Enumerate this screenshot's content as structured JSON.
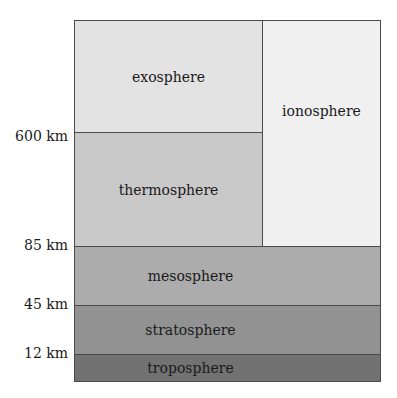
{
  "diagram": {
    "layers": [
      {
        "name": "exosphere",
        "color": "#e3e3e3"
      },
      {
        "name": "thermosphere",
        "color": "#c9c9c9"
      },
      {
        "name": "mesosphere",
        "color": "#acacac"
      },
      {
        "name": "stratosphere",
        "color": "#929292"
      },
      {
        "name": "troposphere",
        "color": "#727272"
      }
    ],
    "overlay": {
      "name": "ionosphere",
      "color": "#f0f0f0"
    },
    "altitude_labels": [
      "600 km",
      "85 km",
      "45 km",
      "12 km"
    ]
  }
}
